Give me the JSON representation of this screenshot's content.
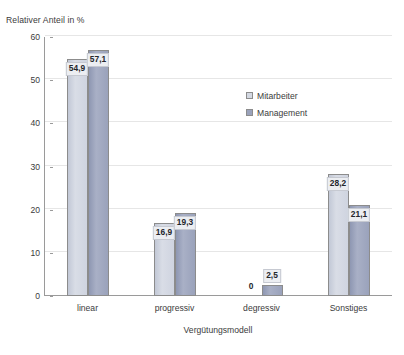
{
  "chart_data": {
    "type": "bar",
    "title": "",
    "subtitle": "",
    "categories": [
      "linear",
      "progressiv",
      "degressiv",
      "Sonstiges"
    ],
    "series": [
      {
        "name": "Mitarbeiter",
        "color": "#d3d8e2",
        "values": [
          54.9,
          16.9,
          0,
          28.2
        ],
        "labels": [
          "54,9",
          "16,9",
          "0",
          "28,2"
        ]
      },
      {
        "name": "Management",
        "color": "#9aa2bb",
        "values": [
          57.1,
          19.3,
          2.5,
          21.1
        ],
        "labels": [
          "57,1",
          "19,3",
          "2,5",
          "21,1"
        ]
      }
    ],
    "xlabel": "Vergütungsmodell",
    "ylabel": "Relativer Anteil in %",
    "ylim": [
      0,
      60
    ],
    "yticks": [
      0,
      10,
      20,
      30,
      40,
      50,
      60
    ],
    "ytick_labels": [
      "0",
      "10",
      "20",
      "30",
      "40",
      "50",
      "60"
    ],
    "grid": true,
    "legend_position": "inside-upper-right"
  },
  "axes": {
    "y_title": "Relativer Anteil in %",
    "x_title": "Vergütungsmodell"
  },
  "legend": {
    "items": [
      {
        "label": "Mitarbeiter",
        "color": "#d3d8e2"
      },
      {
        "label": "Management",
        "color": "#9aa2bb"
      }
    ]
  },
  "colors": {
    "series_mitarbeiter": "#d3d8e2",
    "series_management": "#9aa2bb",
    "gridline": "#e6e6e6",
    "axis": "#9a9a9a",
    "text": "#3b3b3b",
    "label_box_bg": "#eceef2",
    "background": "#ffffff"
  }
}
